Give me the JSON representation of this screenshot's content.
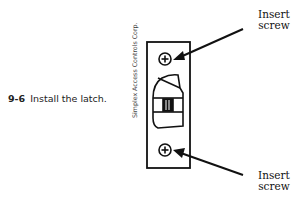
{
  "figure": {
    "number": "9-6",
    "caption": "Install the latch.",
    "credit": "Simplex Access Controls Corp.",
    "callouts": {
      "top": {
        "line1": "Insert",
        "line2": "screw"
      },
      "bottom": {
        "line1": "Insert",
        "line2": "screw"
      }
    }
  }
}
